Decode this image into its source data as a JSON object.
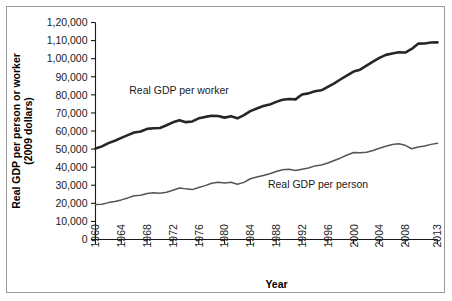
{
  "figure": {
    "border_color": "#9a9a9a",
    "background": "#ffffff"
  },
  "chart_data": {
    "type": "line",
    "title": "",
    "xlabel": "Year",
    "ylabel": "Real GDP per person or worker\n(2009 dollars)",
    "ylabel_line1": "Real GDP per person or worker",
    "ylabel_line2": "(2009 dollars)",
    "grid": false,
    "legend_position": "inline-annotations",
    "xlim": [
      1960,
      2013
    ],
    "ylim": [
      0,
      120000
    ],
    "xticks": [
      1960,
      1964,
      1968,
      1972,
      1976,
      1980,
      1984,
      1988,
      1992,
      1996,
      2000,
      2004,
      2008,
      2013
    ],
    "xtick_labels": [
      "1960",
      "1964",
      "1968",
      "1972",
      "1976",
      "1980",
      "1984",
      "1988",
      "1992",
      "1996",
      "2000",
      "2004",
      "2008",
      "2013"
    ],
    "yticks": [
      0,
      10000,
      20000,
      30000,
      40000,
      50000,
      60000,
      70000,
      80000,
      90000,
      100000,
      110000,
      120000
    ],
    "ytick_labels": [
      "0",
      "10,000",
      "20,000",
      "30,000",
      "40,000",
      "50,000",
      "60,000",
      "70,000",
      "80,000",
      "90,000",
      "1,00,000",
      "1,10,000",
      "1,20,000"
    ],
    "x": [
      1960,
      1961,
      1962,
      1963,
      1964,
      1965,
      1966,
      1967,
      1968,
      1969,
      1970,
      1971,
      1972,
      1973,
      1974,
      1975,
      1976,
      1977,
      1978,
      1979,
      1980,
      1981,
      1982,
      1983,
      1984,
      1985,
      1986,
      1987,
      1988,
      1989,
      1990,
      1991,
      1992,
      1993,
      1994,
      1995,
      1996,
      1997,
      1998,
      1999,
      2000,
      2001,
      2002,
      2003,
      2004,
      2005,
      2006,
      2007,
      2008,
      2009,
      2010,
      2011,
      2012,
      2013
    ],
    "series": [
      {
        "name": "Real GDP per worker",
        "color": "#262626",
        "label_annotation": "Real GDP per worker",
        "values": [
          50300,
          51500,
          53300,
          54600,
          56200,
          57700,
          59200,
          59700,
          61200,
          61500,
          61700,
          63200,
          64800,
          66000,
          64900,
          65300,
          67000,
          67800,
          68400,
          68300,
          67400,
          68200,
          67000,
          68800,
          71000,
          72400,
          73800,
          74600,
          76100,
          77300,
          77700,
          77500,
          80200,
          80800,
          82000,
          82500,
          84400,
          86300,
          88600,
          90800,
          92900,
          93900,
          96100,
          98400,
          100400,
          102100,
          102900,
          103500,
          103400,
          105400,
          108300,
          108400,
          108900,
          109000
        ]
      },
      {
        "name": "Real GDP per person",
        "color": "#555555",
        "label_annotation": "Real GDP per person",
        "values": [
          19300,
          19500,
          20400,
          21000,
          21900,
          23000,
          24200,
          24500,
          25400,
          25900,
          25600,
          26100,
          27200,
          28500,
          28000,
          27600,
          28800,
          29800,
          31100,
          31700,
          31200,
          31700,
          30600,
          31600,
          33600,
          34600,
          35400,
          36400,
          37600,
          38600,
          38800,
          38100,
          38900,
          39500,
          40700,
          41200,
          42300,
          43700,
          45100,
          46700,
          48100,
          48000,
          48300,
          49200,
          50500,
          51600,
          52500,
          52900,
          52100,
          50200,
          51100,
          51700,
          52600,
          53200
        ]
      }
    ],
    "annotations": [
      {
        "text": "Real GDP per worker",
        "x_px": 179,
        "y_px": 94
      },
      {
        "text": "Real GDP per person",
        "x_px": 318,
        "y_px": 188
      }
    ]
  }
}
